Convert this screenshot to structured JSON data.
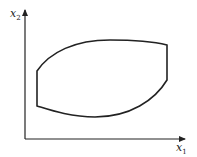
{
  "diagram": {
    "type": "feasible-region-sketch",
    "axes": {
      "x_label": "x",
      "x_sub": "1",
      "y_label": "x",
      "y_sub": "2"
    },
    "colors": {
      "stroke": "#222222",
      "background": "#ffffff"
    },
    "region": {
      "description": "closed region bounded by two vertical segments, a convex upper curve and a convex lower curve",
      "left_edge_x": 37,
      "right_edge_x": 167
    }
  }
}
